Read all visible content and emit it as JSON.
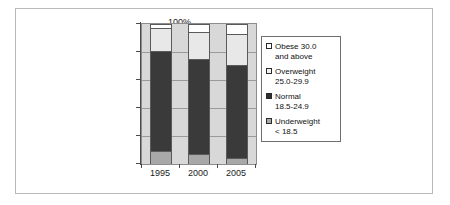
{
  "chart_data": {
    "type": "bar",
    "subtype": "stacked-100-percent",
    "title": "",
    "xlabel": "",
    "ylabel": "",
    "categories": [
      "1995",
      "2000",
      "2005"
    ],
    "ylim": [
      0,
      100
    ],
    "yticks": [
      "0%",
      "20%",
      "40%",
      "60%",
      "80%",
      "100%"
    ],
    "ytick_values": [
      0,
      20,
      40,
      60,
      80,
      100
    ],
    "grid": true,
    "legend_position": "right",
    "series": [
      {
        "name": "Underweight < 18.5",
        "label_line1": "Underweight",
        "label_line2": "< 18.5",
        "swatch": "gray",
        "color": "#a8a8a8",
        "values": [
          9,
          7,
          4
        ]
      },
      {
        "name": "Normal 18.5-24.9",
        "label_line1": "Normal",
        "label_line2": "18.5-24.9",
        "swatch": "black",
        "color": "#3a3a3a",
        "values": [
          72,
          68,
          67
        ]
      },
      {
        "name": "Overweight 25.0-29.9",
        "label_line1": "Overweight",
        "label_line2": "25.0-29.9",
        "swatch": "light",
        "color": "#e8e8e8",
        "values": [
          16,
          19,
          22
        ]
      },
      {
        "name": "Obese 30.0 and above",
        "label_line1": "Obese 30.0",
        "label_line2": "and above",
        "swatch": "white",
        "color": "#ffffff",
        "values": [
          3,
          6,
          7
        ]
      }
    ]
  },
  "legend": {
    "items": [
      {
        "line1": "Obese 30.0",
        "line2": "and above",
        "swatch_class": "sw-obese",
        "icon": "legend-swatch-white"
      },
      {
        "line1": "Overweight",
        "line2": "25.0-29.9",
        "swatch_class": "sw-over",
        "icon": "legend-swatch-light-gray"
      },
      {
        "line1": "Normal",
        "line2": "18.5-24.9",
        "swatch_class": "sw-normal",
        "icon": "legend-swatch-black"
      },
      {
        "line1": "Underweight",
        "line2": "< 18.5",
        "swatch_class": "sw-under",
        "icon": "legend-swatch-gray"
      }
    ]
  }
}
